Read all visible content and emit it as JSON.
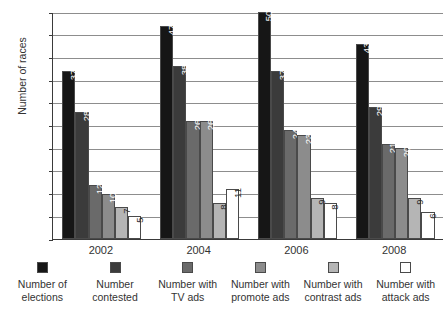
{
  "chart_data": {
    "type": "bar",
    "title": "",
    "xlabel": "",
    "ylabel": "Number of races",
    "ylim": [
      0,
      50
    ],
    "ytick_step": 5,
    "yticks": [
      0,
      5,
      10,
      15,
      20,
      25,
      30,
      35,
      40,
      45,
      50
    ],
    "grid": true,
    "legend_position": "bottom",
    "categories": [
      "2002",
      "2004",
      "2006",
      "2008"
    ],
    "series": [
      {
        "name": "Number of elections",
        "legend_line1": "Number of",
        "legend_line2": "elections",
        "color": "#161616",
        "label_color": "light",
        "values": [
          37,
          47,
          50,
          43
        ]
      },
      {
        "name": "Number contested",
        "legend_line1": "Number",
        "legend_line2": "contested",
        "color": "#3b3b3b",
        "label_color": "light",
        "values": [
          28,
          38,
          37,
          29
        ]
      },
      {
        "name": "Number with TV ads",
        "legend_line1": "Number with",
        "legend_line2": "TV ads",
        "color": "#6a6a6a",
        "label_color": "light",
        "values": [
          12,
          26,
          24,
          21
        ]
      },
      {
        "name": "Number with promote ads",
        "legend_line1": "Number with",
        "legend_line2": "promote ads",
        "color": "#8c8c8c",
        "label_color": "light",
        "values": [
          10,
          26,
          23,
          20
        ]
      },
      {
        "name": "Number with contrast ads",
        "legend_line1": "Number with",
        "legend_line2": "contrast ads",
        "color": "#b5b5b5",
        "label_color": "dark",
        "values": [
          7,
          8,
          9,
          9
        ]
      },
      {
        "name": "Number with attack ads",
        "legend_line1": "Number with",
        "legend_line2": "attack ads",
        "color": "#ffffff",
        "label_color": "dark",
        "values": [
          5,
          11,
          8,
          6
        ]
      }
    ]
  }
}
